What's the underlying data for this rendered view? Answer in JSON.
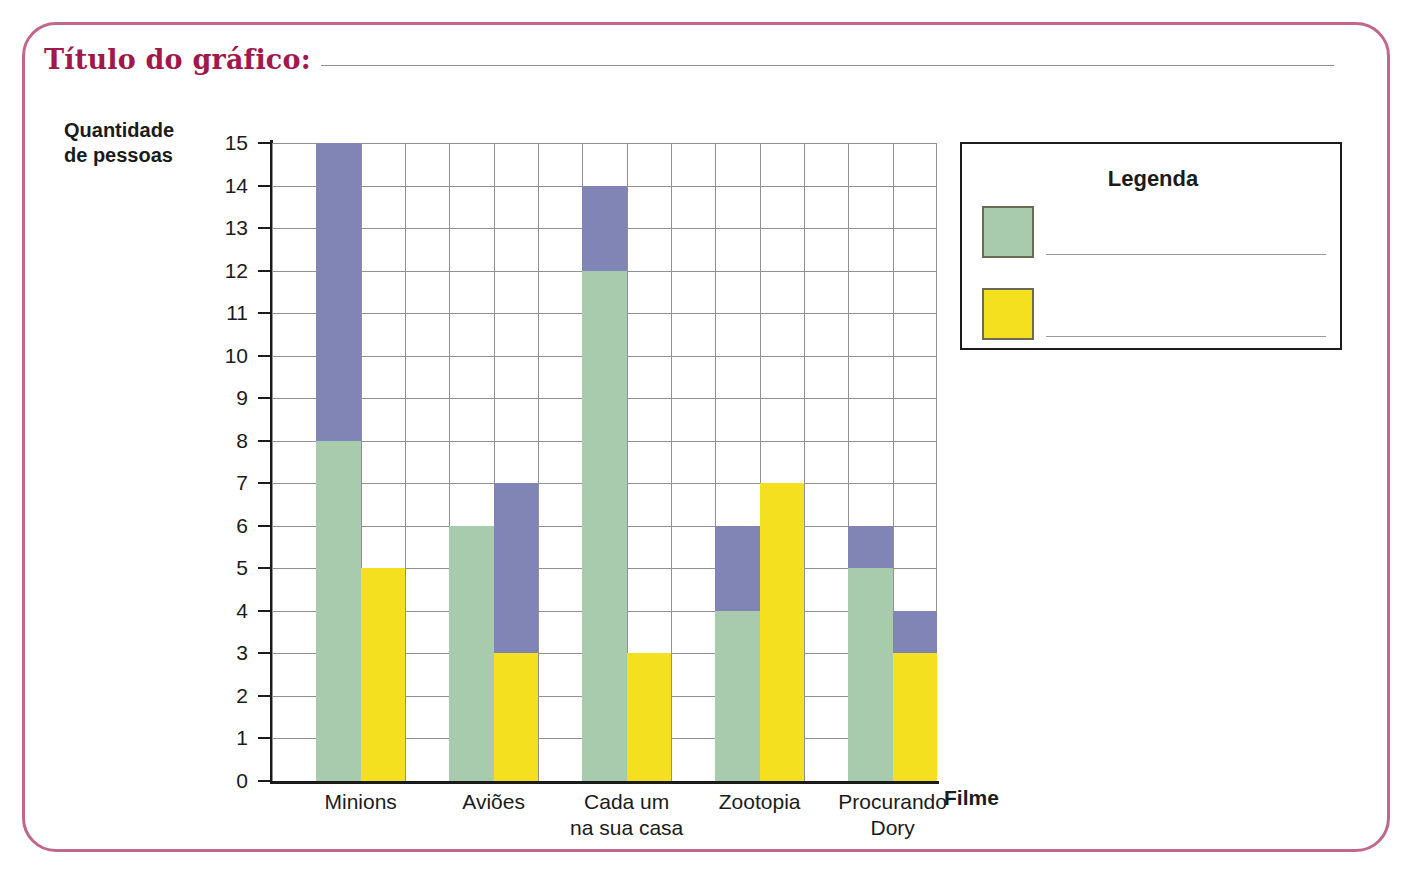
{
  "worksheet": {
    "title_label": "Título do gráfico:",
    "title_value": "",
    "border_color": "#c2678c",
    "title_color": "#a2184a"
  },
  "legend": {
    "title": "Legenda",
    "items": [
      {
        "swatch_color": "#a8cbad",
        "label": ""
      },
      {
        "swatch_color": "#f5e01f",
        "label": ""
      }
    ]
  },
  "chart_data": {
    "type": "bar",
    "title": "",
    "xlabel": "Filme",
    "ylabel": "Quantidade de pessoas",
    "ylim": [
      0,
      15
    ],
    "ytick_labels": [
      "15",
      "14",
      "13",
      "12",
      "11",
      "10",
      "9",
      "8",
      "7",
      "6",
      "5",
      "4",
      "3",
      "2",
      "1",
      "0"
    ],
    "grid": true,
    "legend_position": "right",
    "categories": [
      "Minions",
      "Aviões",
      "Cada um\nna sua casa",
      "Zootopia",
      "Procurando\nDory"
    ],
    "category_lines": [
      [
        "Minions"
      ],
      [
        "Aviões"
      ],
      [
        "Cada um",
        "na sua casa"
      ],
      [
        "Zootopia"
      ],
      [
        "Procurando",
        "Dory"
      ]
    ],
    "colors": {
      "green": "#a8cbad",
      "yellow": "#f5e01f",
      "purple": "#8185b5"
    },
    "series": [
      {
        "name": "green",
        "values": [
          8,
          6,
          12,
          4,
          5
        ]
      },
      {
        "name": "yellow",
        "values": [
          5,
          3,
          3,
          7,
          3
        ]
      },
      {
        "name": "purple_on_green",
        "values": [
          15,
          0,
          14,
          6,
          6
        ]
      },
      {
        "name": "purple_on_yellow",
        "values": [
          0,
          7,
          0,
          0,
          4
        ]
      }
    ],
    "bars": [
      {
        "category": "Minions",
        "green_value": 8,
        "green_purple_top": 15,
        "yellow_value": 5,
        "yellow_purple_top": 0
      },
      {
        "category": "Aviões",
        "green_value": 6,
        "green_purple_top": 0,
        "yellow_value": 3,
        "yellow_purple_top": 7
      },
      {
        "category": "Cada um na sua casa",
        "green_value": 12,
        "green_purple_top": 14,
        "yellow_value": 3,
        "yellow_purple_top": 0
      },
      {
        "category": "Zootopia",
        "green_value": 4,
        "green_purple_top": 6,
        "yellow_value": 7,
        "yellow_purple_top": 0
      },
      {
        "category": "Procurando Dory",
        "green_value": 5,
        "green_purple_top": 6,
        "yellow_value": 3,
        "yellow_purple_top": 4
      }
    ]
  }
}
